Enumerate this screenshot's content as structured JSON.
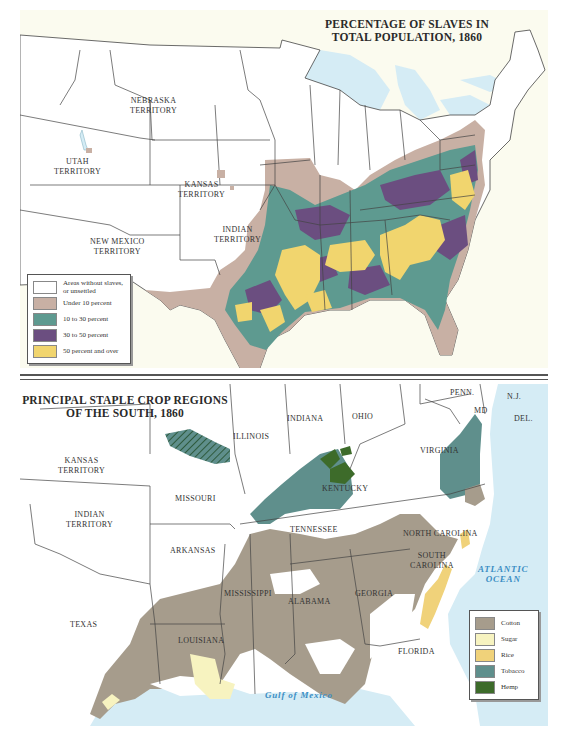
{
  "top_map": {
    "title_line1": "PERCENTAGE OF SLAVES IN",
    "title_line2": "TOTAL POPULATION, 1860",
    "labels": {
      "nebraska": [
        "NEBRASKA",
        "TERRITORY"
      ],
      "utah": [
        "UTAH",
        "TERRITORY"
      ],
      "kansas": [
        "KANSAS",
        "TERRITORY"
      ],
      "indian": [
        "INDIAN",
        "TERRITORY"
      ],
      "new_mexico": [
        "NEW MEXICO",
        "TERRITORY"
      ]
    },
    "legend": [
      {
        "label": "Areas without slaves, or unsettled",
        "color": "#ffffff"
      },
      {
        "label": "Under 10 percent",
        "color": "#c8b0a4"
      },
      {
        "label": "10 to 30 percent",
        "color": "#5e9a90"
      },
      {
        "label": "30 to 50 percent",
        "color": "#6b4e80"
      },
      {
        "label": "50 percent and over",
        "color": "#f1d56e"
      }
    ]
  },
  "bottom_map": {
    "title_line1": "PRINCIPAL STAPLE CROP REGIONS",
    "title_line2": "OF THE SOUTH, 1860",
    "labels": {
      "illinois": "ILLINOIS",
      "indiana": "INDIANA",
      "ohio": "OHIO",
      "penn": "PENN.",
      "nj": "N.J.",
      "md": "MD",
      "del": "DEL.",
      "kansas": [
        "KANSAS",
        "TERRITORY"
      ],
      "missouri": "MISSOURI",
      "kentucky": "KENTUCKY",
      "virginia": "VIRGINIA",
      "indian": [
        "INDIAN",
        "TERRITORY"
      ],
      "tennessee": "TENNESSEE",
      "north_carolina": "NORTH CAROLINA",
      "arkansas": "ARKANSAS",
      "south_carolina": [
        "SOUTH",
        "CAROLINA"
      ],
      "mississippi": "MISSISSIPPI",
      "alabama": "ALABAMA",
      "georgia": "GEORGIA",
      "texas": "TEXAS",
      "louisiana": "LOUISIANA",
      "florida": "FLORIDA"
    },
    "oceans": {
      "atlantic": [
        "ATLANTIC",
        "OCEAN"
      ],
      "gulf": "Gulf of Mexico"
    },
    "legend": [
      {
        "label": "Cotton",
        "color": "#a69c8c"
      },
      {
        "label": "Sugar",
        "color": "#f7f3c0"
      },
      {
        "label": "Rice",
        "color": "#f0d27a"
      },
      {
        "label": "Tobacco",
        "color": "#5f8f8c"
      },
      {
        "label": "Hemp",
        "color": "#3d6b2a"
      }
    ]
  },
  "colors": {
    "water": "#d5ecf5",
    "land": "#ffffff",
    "border": "#444444"
  }
}
